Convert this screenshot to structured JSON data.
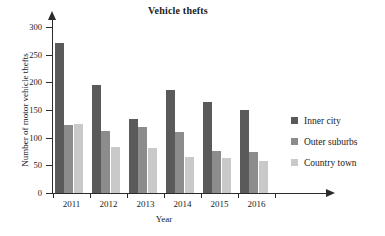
{
  "chart_data": {
    "type": "bar",
    "title": "Vehicle thefts",
    "xlabel": "Year",
    "ylabel": "Number of motor vehicle thefts",
    "categories": [
      "2011",
      "2012",
      "2013",
      "2014",
      "2015",
      "2016"
    ],
    "series": [
      {
        "name": "Inner city",
        "color": "#5a5a5a",
        "values": [
          271,
          196,
          134,
          187,
          165,
          150
        ]
      },
      {
        "name": "Outer suburbs",
        "color": "#8c8c8c",
        "values": [
          123,
          112,
          119,
          110,
          76,
          74
        ]
      },
      {
        "name": "Country town",
        "color": "#c9c9c9",
        "values": [
          125,
          84,
          81,
          65,
          63,
          58
        ]
      }
    ],
    "ylim": [
      0,
      300
    ],
    "yticks": [
      0,
      50,
      100,
      150,
      200,
      250,
      300
    ],
    "ytick_labels": [
      "0",
      "50",
      "100",
      "150",
      "200",
      "250",
      "300"
    ],
    "grid": false,
    "legend_position": "right"
  },
  "axis": {
    "y_arrow": "up-arrow-icon",
    "x_arrow": "right-arrow-icon"
  }
}
